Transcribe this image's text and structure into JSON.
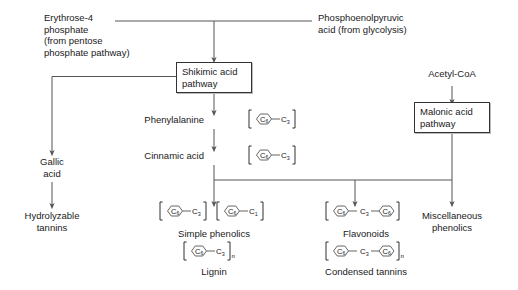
{
  "diagram": {
    "stroke_color": "#555555",
    "box_border_color": "#333333",
    "text_color": "#1a1a1a"
  },
  "inputs": {
    "erythrose": "Erythrose-4\nphosphate\n(from pentose\nphosphate pathway)",
    "pep": "Phosphoenolpyruvic\nacid (from glycolysis)",
    "acetyl_coa": "Acetyl-CoA"
  },
  "pathway_boxes": [
    {
      "id": "shikimic",
      "label": "Shikimic acid\npathway"
    },
    {
      "id": "malonic",
      "label": "Malonic acid\npathway"
    }
  ],
  "intermediates": {
    "phenylalanine": "Phenylalanine",
    "cinnamic_acid": "Cinnamic acid",
    "gallic_acid": "Gallic\nacid"
  },
  "products": {
    "hydrolyzable_tannins": "Hydrolyzable\ntannins",
    "simple_phenolics": "Simple phenolics",
    "lignin": "Lignin",
    "flavonoids": "Flavonoids",
    "condensed_tannins": "Condensed tannins",
    "miscellaneous_phenolics": "Miscellaneous\nphenolics"
  },
  "formulas": {
    "phenylalanine": {
      "ring": "C",
      "ring_sub": "6",
      "unit": "C",
      "unit_sub": "3",
      "repeat": ""
    },
    "cinnamic_acid": {
      "ring": "C",
      "ring_sub": "6",
      "unit": "C",
      "unit_sub": "3",
      "repeat": ""
    },
    "simple_phenolics_a": {
      "ring": "C",
      "ring_sub": "6",
      "unit": "C",
      "unit_sub": "3",
      "repeat": ""
    },
    "simple_phenolics_b": {
      "ring": "C",
      "ring_sub": "6",
      "unit": "C",
      "unit_sub": "1",
      "repeat": ""
    },
    "lignin": {
      "ring": "C",
      "ring_sub": "6",
      "unit": "C",
      "unit_sub": "3",
      "repeat": "n"
    },
    "flavonoids": {
      "ring": "C",
      "ring_sub": "6",
      "unit": "C",
      "unit_sub": "3",
      "ring2": "C",
      "ring2_sub": "6",
      "repeat": ""
    },
    "condensed_tannins": {
      "ring": "C",
      "ring_sub": "6",
      "unit": "C",
      "unit_sub": "3",
      "ring2": "C",
      "ring2_sub": "6",
      "repeat": "n"
    }
  }
}
